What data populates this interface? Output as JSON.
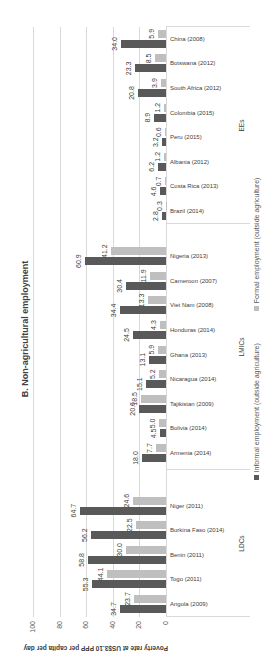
{
  "chart_data": {
    "type": "bar",
    "orientation": "vertical bars, image rotated 90 degrees counter-clockwise",
    "title": "B. Non-agricultural employment",
    "xlabel": "",
    "ylabel": "Poverty rate at US$3.10 PPP per capita per day",
    "ylim": [
      0,
      100
    ],
    "yticks": [
      0,
      20,
      40,
      60,
      80,
      100
    ],
    "grid": true,
    "legend_position": "bottom",
    "groups": [
      {
        "name": "LDCs",
        "categories": [
          "Angola (2009)",
          "Togo (2011)",
          "Benin (2011)",
          "Burkina Faso (2014)",
          "Niger (2011)"
        ]
      },
      {
        "name": "LMICs",
        "categories": [
          "Armenia (2014)",
          "Bolivia (2014)",
          "Tajikistan (2009)",
          "Nicaragua (2014)",
          "Ghana (2013)",
          "Honduras (2014)",
          "Viet Nam (2008)",
          "Cameroon (2007)",
          "Nigeria (2013)"
        ]
      },
      {
        "name": "EEs",
        "categories": [
          "Brazil (2014)",
          "Costa Rica (2013)",
          "Albania (2012)",
          "Peru (2015)",
          "Colombia (2015)",
          "South Africa (2012)",
          "Botswana (2012)",
          "China (2008)"
        ]
      }
    ],
    "categories": [
      "Angola (2009)",
      "Togo (2011)",
      "Benin (2011)",
      "Burkina Faso (2014)",
      "Niger (2011)",
      "Armenia (2014)",
      "Bolivia (2014)",
      "Tajikistan (2009)",
      "Nicaragua (2014)",
      "Ghana (2013)",
      "Honduras (2014)",
      "Viet Nam (2008)",
      "Cameroon (2007)",
      "Nigeria (2013)",
      "Brazil (2014)",
      "Costa Rica (2013)",
      "Albania (2012)",
      "Peru (2015)",
      "Colombia (2015)",
      "South Africa (2012)",
      "Botswana (2012)",
      "China (2008)"
    ],
    "series": [
      {
        "name": "Informal employment (outside agriculture)",
        "color": "#595959",
        "values": [
          34.7,
          55.3,
          58.8,
          56.2,
          64.7,
          18.0,
          4.5,
          20.6,
          15.1,
          13.1,
          24.5,
          34.4,
          30.4,
          60.9,
          2.8,
          4.6,
          6.2,
          3.2,
          8.9,
          20.8,
          23.3,
          34.0
        ]
      },
      {
        "name": "Formal employment (outside agriculture)",
        "color": "#bfbfbf",
        "values": [
          23.7,
          44.1,
          30.0,
          22.5,
          24.6,
          7.7,
          5.0,
          18.5,
          5.2,
          5.9,
          4.3,
          13.3,
          11.9,
          41.2,
          0.3,
          0.7,
          1.2,
          0.6,
          1.2,
          3.9,
          8.5,
          5.9
        ]
      }
    ]
  }
}
